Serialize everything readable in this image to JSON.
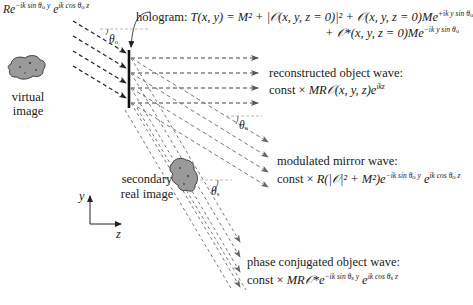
{
  "diagram": {
    "type": "holography-reconstruction",
    "reference_wave": {
      "label_prefix": "R",
      "exp1": "−ik sin θ",
      "exp1_sub": "o",
      "exp1_tail": " y",
      "exp2": "ik cos θ",
      "exp2_sub": "o",
      "exp2_tail": " z"
    },
    "angle_labels": {
      "incident": "θ",
      "incident_sub": "o",
      "mirror": "θ",
      "mirror_sub": "o",
      "secondary": "θ",
      "secondary_sub": "s"
    },
    "hologram": {
      "label": "hologram:",
      "line1": "T(x, y) = M² + |𝒪(x, y, z = 0)|² + 𝒪(x, y, z = 0)Me",
      "line1_exp": "+ik y sin θ",
      "line1_exp_sub": "o",
      "line2": "+ 𝒪*(x, y, z = 0)Me",
      "line2_exp": "−ik y sin θ",
      "line2_exp_sub": "o"
    },
    "virtual_image": {
      "line1": "virtual",
      "line2": "image"
    },
    "secondary_image": {
      "line1": "secondary",
      "line2": "real image"
    },
    "axes": {
      "y": "y",
      "z": "z"
    },
    "outputs": [
      {
        "title": "reconstructed object wave:",
        "formula_pre": "const × ",
        "formula_it": "MR𝒪(x, y, z)e",
        "formula_exp": "ikz"
      },
      {
        "title": "modulated mirror wave:",
        "formula_pre": "const × ",
        "formula_it": "R",
        "formula_mid": "(|𝒪|² + M²)e",
        "formula_exp1": "−ik sin θ",
        "formula_exp1_sub": "o",
        "formula_exp1_tail": " y",
        "formula_e2": " e",
        "formula_exp2": "ik cos θ",
        "formula_exp2_sub": "o",
        "formula_exp2_tail": " z"
      },
      {
        "title": "phase conjugated object wave:",
        "formula_pre": "const × ",
        "formula_it": "MR𝒪*e",
        "formula_exp1": "−ik sin θ",
        "formula_exp1_sub": "s",
        "formula_exp1_tail": " y",
        "formula_e2": " e",
        "formula_exp2": "ik cos θ",
        "formula_exp2_sub": "s",
        "formula_exp2_tail": " z"
      }
    ],
    "colors": {
      "incident_ray": "#222222",
      "output_ray": "#555555",
      "diffracted_ray": "#777777",
      "object_fill": "#9a9a9a",
      "object_stroke": "#333333",
      "angle_guide": "#aaaaaa"
    }
  }
}
